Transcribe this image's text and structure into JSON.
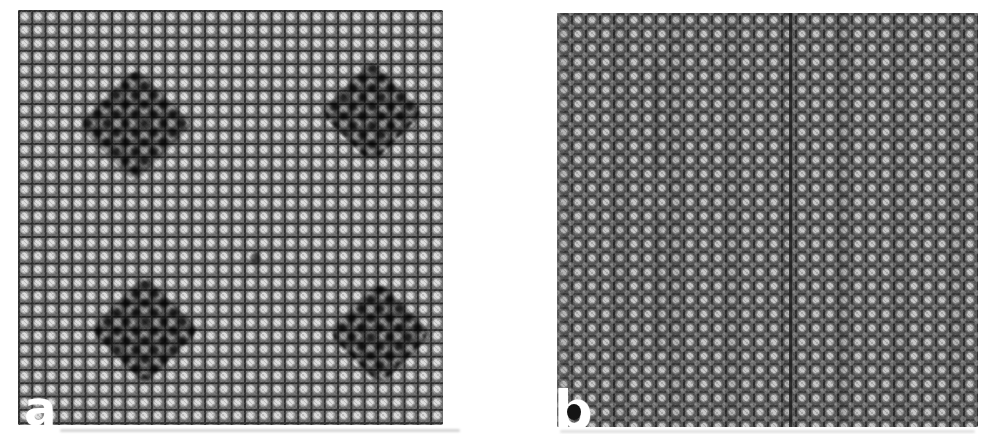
{
  "figure": {
    "panels": [
      {
        "label": "a"
      },
      {
        "label": "b"
      }
    ]
  },
  "colors": {
    "background": "#ffffff",
    "panel_a_base": "#6e6e6e",
    "panel_a_dot": "#dcdcdc",
    "panel_a_grid": "#2e2e2e",
    "panel_b_base": "#585858",
    "panel_b_dot": "#c6c6c6",
    "defect_cluster": "#161616",
    "scratch_line": "#1f1f1f",
    "label": "#ffffff"
  }
}
